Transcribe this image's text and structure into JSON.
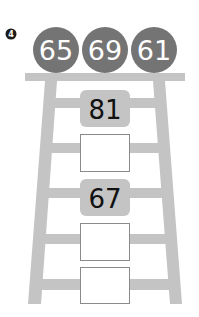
{
  "problem": {
    "number": "4",
    "badge_color": "#1a1a1a"
  },
  "circles": [
    {
      "value": "65"
    },
    {
      "value": "69"
    },
    {
      "value": "61"
    }
  ],
  "ladder": {
    "color": "#c4c4c4",
    "boxes": [
      {
        "value": "81",
        "filled": true
      },
      {
        "value": "",
        "filled": false
      },
      {
        "value": "67",
        "filled": true
      },
      {
        "value": "",
        "filled": false
      },
      {
        "value": "",
        "filled": false
      }
    ]
  },
  "colors": {
    "circle_fill": "#747474",
    "circle_text": "#ffffff",
    "filled_box": "#c4c4c4",
    "empty_box_border": "#8a8a8a",
    "text": "#111111"
  }
}
